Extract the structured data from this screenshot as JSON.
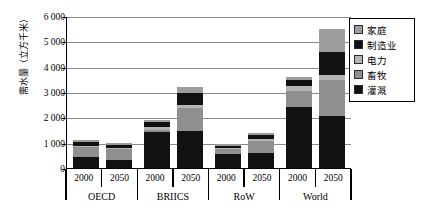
{
  "chart_data": {
    "type": "bar",
    "stacked": true,
    "title": "",
    "xlabel": "",
    "ylabel": "需水量（立方千米）",
    "ylim": [
      0,
      6000
    ],
    "yticks": [
      "0",
      "1 000",
      "2 000",
      "3 000",
      "4 000",
      "5 000",
      "6 000"
    ],
    "ytick_values": [
      0,
      1000,
      2000,
      3000,
      4000,
      5000,
      6000
    ],
    "grid": true,
    "legend_position": "top-right",
    "groups": [
      "OECD",
      "BRIICS",
      "RoW",
      "World"
    ],
    "x": [
      "2000",
      "2050",
      "2000",
      "2050",
      "2000",
      "2050",
      "2000",
      "2050"
    ],
    "categories": [
      "OECD 2000",
      "OECD 2050",
      "BRIICS 2000",
      "BRIICS 2050",
      "RoW 2000",
      "RoW 2050",
      "World 2000",
      "World 2050"
    ],
    "series": [
      {
        "name": "灌溉",
        "color": "#111111",
        "values": [
          420,
          330,
          1430,
          1480,
          560,
          610,
          2400,
          2050
        ]
      },
      {
        "name": "畜牧",
        "color": "#8f8f8f",
        "values": [
          390,
          430,
          80,
          900,
          200,
          460,
          640,
          1440
        ]
      },
      {
        "name": "电力",
        "color": "#b4b4b4",
        "values": [
          60,
          40,
          120,
          120,
          30,
          60,
          180,
          200
        ]
      },
      {
        "name": "制造业",
        "color": "#111111",
        "values": [
          140,
          110,
          180,
          450,
          90,
          180,
          260,
          900
        ]
      },
      {
        "name": "家庭",
        "color": "#9d9d9d",
        "values": [
          90,
          70,
          90,
          250,
          70,
          90,
          120,
          880
        ]
      }
    ],
    "totals": [
      1100,
      980,
      1900,
      3200,
      950,
      1400,
      3600,
      5470
    ]
  },
  "legend": {
    "items": [
      {
        "label": "家庭",
        "color": "#9d9d9d"
      },
      {
        "label": "制造业",
        "color": "#111111"
      },
      {
        "label": "电力",
        "color": "#b4b4b4"
      },
      {
        "label": "畜牧",
        "color": "#8f8f8f"
      },
      {
        "label": "灌溉",
        "color": "#111111"
      }
    ]
  }
}
